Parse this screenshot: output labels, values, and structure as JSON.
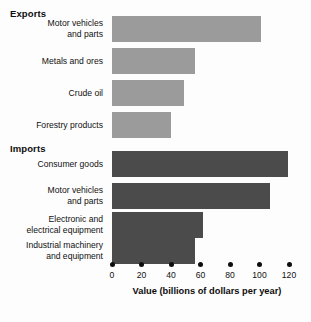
{
  "chart_data": {
    "type": "bar",
    "orientation": "horizontal",
    "title": "",
    "xlabel": "Value (billions of dollars per year)",
    "ylabel": "",
    "xlim": [
      0,
      120
    ],
    "xticks": [
      0,
      20,
      40,
      60,
      80,
      100,
      120
    ],
    "xticklabels": [
      "0",
      "20",
      "40",
      "60",
      "80",
      "100",
      "120"
    ],
    "grid": false,
    "legend": false,
    "groups": [
      {
        "name": "Exports",
        "color": "#9b9b9b",
        "categories": [
          "Motor vehicles\nand parts",
          "Metals and ores",
          "Crude oil",
          "Forestry products"
        ],
        "values": [
          101,
          56,
          49,
          40
        ]
      },
      {
        "name": "Imports",
        "color": "#4b4b4b",
        "categories": [
          "Consumer goods",
          "Motor vehicles\nand parts",
          "Electronic and\nelectrical equipment",
          "Industrial machinery\nand equipment"
        ],
        "values": [
          119,
          107,
          62,
          56
        ]
      }
    ]
  },
  "headings": {
    "exports": "Exports",
    "imports": "Imports"
  },
  "axis": {
    "title": "Value (billions of dollars per year)",
    "ticks": [
      "0",
      "20",
      "40",
      "60",
      "80",
      "100",
      "120"
    ]
  },
  "colors": {
    "exports_bar": "#9b9b9b",
    "imports_bar": "#4b4b4b",
    "text": "#111111",
    "background": "#fdfdfd"
  }
}
